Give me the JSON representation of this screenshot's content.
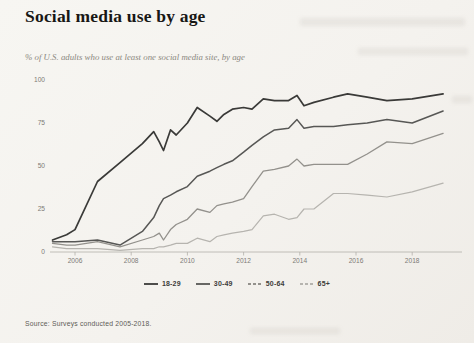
{
  "header": {
    "title": "Social media use by age",
    "subtitle": "% of U.S. adults who use at least one social media site, by age"
  },
  "footer": {
    "source": "Source: Surveys conducted 2005-2018."
  },
  "colors": {
    "axis": "#b3b0a9",
    "tick_label": "#7d7b76",
    "paper": "#f6f4f0"
  },
  "chart_data": {
    "type": "line",
    "title": "Social media use by age",
    "subtitle": "% of U.S. adults who use at least one social media site, by age",
    "xlabel": "",
    "ylabel": "% of U.S. adults",
    "xlim": [
      2005.0,
      2019.7
    ],
    "ylim": [
      0,
      100
    ],
    "grid": false,
    "legend_position": "bottom",
    "x_ticks": [
      2006,
      2008,
      2010,
      2012,
      2014,
      2016,
      2018
    ],
    "y_ticks": [
      0,
      25,
      50,
      75,
      100
    ],
    "x": [
      2005.2,
      2005.7,
      2006.0,
      2006.8,
      2007.6,
      2008.4,
      2008.8,
      2009.0,
      2009.15,
      2009.4,
      2009.6,
      2010.0,
      2010.35,
      2010.8,
      2011.05,
      2011.3,
      2011.6,
      2012.0,
      2012.3,
      2012.7,
      2013.1,
      2013.6,
      2013.9,
      2014.15,
      2014.5,
      2015.2,
      2015.7,
      2016.4,
      2017.1,
      2018.0,
      2019.1
    ],
    "series": [
      {
        "name": "18-29",
        "color": "#3a3a38",
        "width": 1.7,
        "legend_dash": "none",
        "values": [
          7,
          10,
          13,
          41,
          52,
          63,
          70,
          64,
          59,
          71,
          68,
          75,
          84,
          79,
          76,
          80,
          83,
          84,
          83,
          89,
          88,
          88,
          91,
          85,
          87,
          90,
          92,
          90,
          88,
          89,
          92
        ]
      },
      {
        "name": "30-49",
        "color": "#575755",
        "width": 1.5,
        "legend_dash": "none",
        "values": [
          6,
          6,
          6,
          7,
          4,
          12,
          20,
          27,
          31,
          33,
          35,
          38,
          44,
          47,
          49,
          51,
          53,
          58,
          62,
          67,
          71,
          72,
          77,
          72,
          73,
          73,
          74,
          75,
          77,
          75,
          82
        ]
      },
      {
        "name": "50-64",
        "color": "#93918c",
        "width": 1.3,
        "legend_dash": "3 2",
        "values": [
          5,
          4,
          4,
          6,
          3,
          7,
          9,
          11,
          7,
          13,
          16,
          19,
          25,
          23,
          27,
          28,
          29,
          31,
          38,
          47,
          48,
          50,
          54,
          50,
          51,
          51,
          51,
          57,
          64,
          63,
          69
        ]
      },
      {
        "name": "65+",
        "color": "#b6b4af",
        "width": 1.2,
        "legend_dash": "3 2",
        "values": [
          3,
          2,
          2,
          2,
          1,
          2,
          2,
          3,
          3,
          4,
          5,
          5,
          8,
          6,
          9,
          10,
          11,
          12,
          13,
          21,
          22,
          19,
          20,
          25,
          25,
          34,
          34,
          33,
          32,
          35,
          40
        ]
      }
    ]
  }
}
